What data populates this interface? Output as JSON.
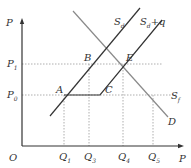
{
  "diagram": {
    "title": "",
    "axes": {
      "y_label": "P",
      "x_label": "P",
      "origin_label": "O"
    },
    "price_levels": [
      {
        "label": "P",
        "sub": "1",
        "y": 64
      },
      {
        "label": "P",
        "sub": "0",
        "y": 95
      }
    ],
    "quantity_levels": [
      {
        "label": "Q",
        "sub": "1",
        "x": 64
      },
      {
        "label": "Q",
        "sub": "3",
        "x": 89
      },
      {
        "label": "Q",
        "sub": "4",
        "x": 123
      },
      {
        "label": "Q",
        "sub": "5",
        "x": 153
      }
    ],
    "points": [
      {
        "label": "A",
        "x": 64,
        "y": 95
      },
      {
        "label": "B",
        "x": 89,
        "y": 64
      },
      {
        "label": "C",
        "x": 100,
        "y": 95
      },
      {
        "label": "E",
        "x": 123,
        "y": 64
      }
    ],
    "curves": [
      {
        "name": "S_d",
        "label": "S",
        "sub": "d",
        "color": "#333333"
      },
      {
        "name": "S_d+q",
        "label": "S",
        "sub": "d",
        "suffix": "+q",
        "color": "#333333"
      },
      {
        "name": "D",
        "label": "D",
        "color": "#888888"
      },
      {
        "name": "S_f",
        "label": "S",
        "sub": "f",
        "color": "#333333"
      }
    ],
    "colors": {
      "axis": "#333333",
      "supply": "#333333",
      "demand": "#8a8a8a",
      "guide": "#9a9a9a"
    }
  }
}
